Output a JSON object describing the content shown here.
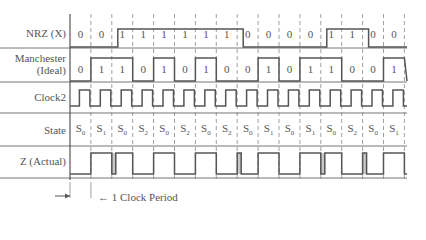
{
  "diagram": {
    "rows": [
      {
        "id": "nrz",
        "label": "NRZ (X)"
      },
      {
        "id": "manchester",
        "label_line1": "Manchester",
        "label_line2": "(Ideal)"
      },
      {
        "id": "clock2",
        "label": "Clock2"
      },
      {
        "id": "state",
        "label": "State"
      },
      {
        "id": "z",
        "label": "Z (Actual)"
      }
    ],
    "num_periods": 16,
    "nrz_bits": [
      "0",
      "0",
      "1",
      "1",
      "1",
      "1",
      "1",
      "1",
      "0",
      "0",
      "0",
      "0",
      "1",
      "1",
      "0",
      "0"
    ],
    "manchester_bits": [
      "0",
      "1",
      "1",
      "0",
      "1",
      "0",
      "1",
      "0",
      "0",
      "1",
      "0",
      "1",
      "1",
      "0",
      "0",
      "1"
    ],
    "states": [
      "0",
      "1",
      "0",
      "2",
      "0",
      "2",
      "0",
      "2",
      "0",
      "1",
      "0",
      "1",
      "0",
      "2",
      "0",
      "1"
    ],
    "state_prefix": "S",
    "z_high_periods": [
      1,
      2,
      4,
      6,
      9,
      11,
      12,
      15
    ],
    "z_glitch_positions": [
      2,
      8,
      12,
      14
    ],
    "annotation": "1 Clock Period",
    "colors": {
      "line": "#555555",
      "glitch": "#c8c8c8",
      "divider": "#777777"
    }
  }
}
